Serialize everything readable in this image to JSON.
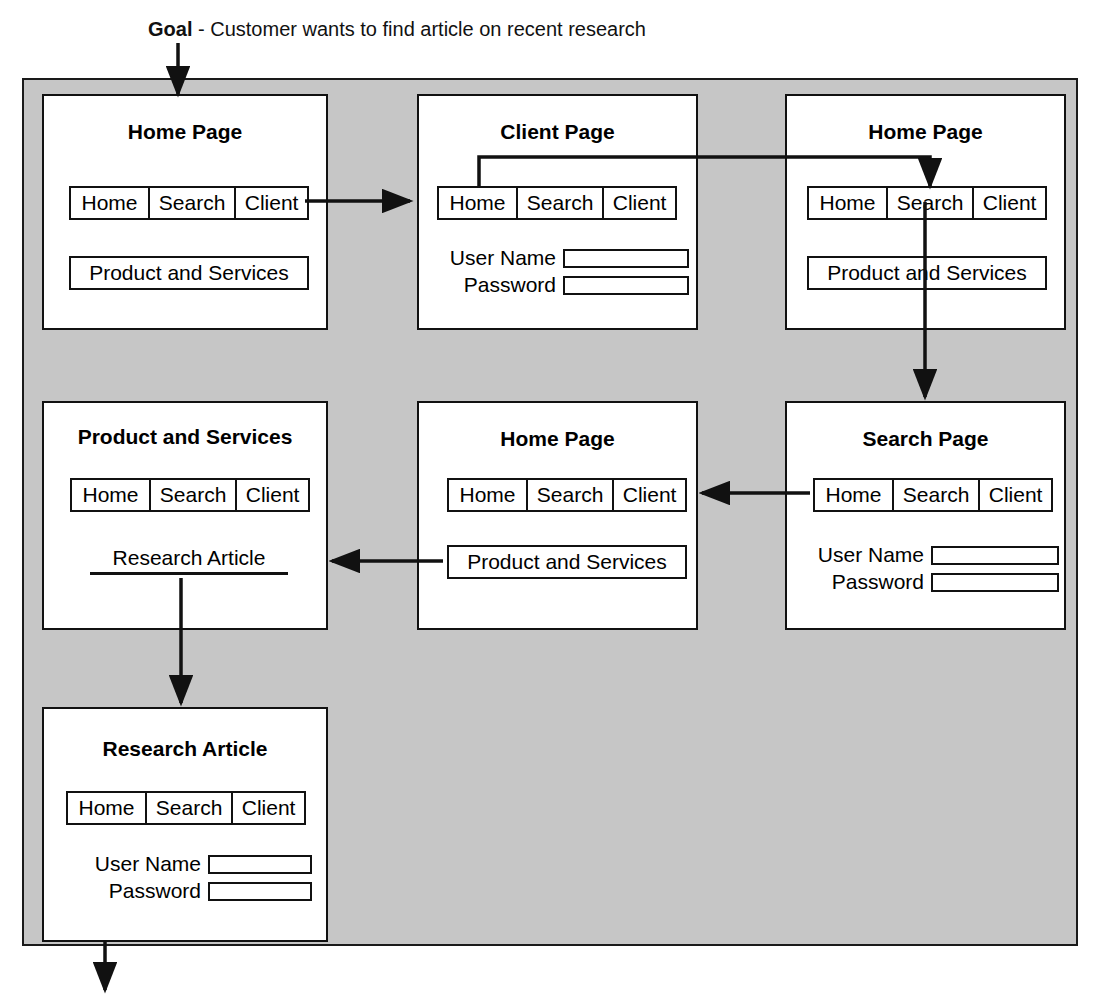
{
  "goal": {
    "label": "Goal",
    "separator": " - ",
    "text": "Customer wants to find article on recent research"
  },
  "colors": {
    "frame_background": "#c6c6c6",
    "card_background": "#ffffff",
    "line": "#111111",
    "text": "#000000"
  },
  "nav": {
    "tabs": [
      "Home",
      "Search",
      "Client"
    ]
  },
  "form": {
    "username_label": "User Name",
    "password_label": "Password",
    "username_value": "",
    "password_value": "",
    "username_placeholder": "",
    "password_placeholder": ""
  },
  "labels": {
    "product_and_services": "Product and Services",
    "research_article": "Research Article"
  },
  "pages": [
    {
      "id": "home-page-1",
      "title": "Home Page",
      "tabs": [
        "Home",
        "Search",
        "Client"
      ],
      "button": "Product and Services"
    },
    {
      "id": "client-page",
      "title": "Client Page",
      "tabs": [
        "Home",
        "Search",
        "Client"
      ],
      "username_label": "User Name",
      "password_label": "Password"
    },
    {
      "id": "home-page-2",
      "title": "Home Page",
      "tabs": [
        "Home",
        "Search",
        "Client"
      ],
      "button": "Product and Services"
    },
    {
      "id": "product-and-services-page",
      "title": "Product and Services",
      "tabs": [
        "Home",
        "Search",
        "Client"
      ],
      "link": "Research Article"
    },
    {
      "id": "home-page-3",
      "title": "Home Page",
      "tabs": [
        "Home",
        "Search",
        "Client"
      ],
      "button": "Product and Services"
    },
    {
      "id": "search-page",
      "title": "Search Page",
      "tabs": [
        "Home",
        "Search",
        "Client"
      ],
      "username_label": "User Name",
      "password_label": "Password"
    },
    {
      "id": "research-article-page",
      "title": "Research Article",
      "tabs": [
        "Home",
        "Search",
        "Client"
      ],
      "username_label": "User Name",
      "password_label": "Password"
    }
  ]
}
